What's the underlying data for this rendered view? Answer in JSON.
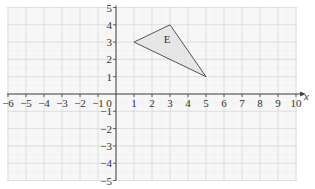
{
  "diagram": {
    "type": "coordinate-grid",
    "x_axis": {
      "label": "x",
      "min": -6,
      "max": 10,
      "ticks": [
        "-6",
        "-5",
        "-4",
        "-3",
        "-2",
        "-1",
        "0",
        "1",
        "2",
        "3",
        "4",
        "5",
        "6",
        "7",
        "8",
        "9",
        "10"
      ]
    },
    "y_axis": {
      "min": -5,
      "max": 5,
      "ticks": [
        "5",
        "4",
        "3",
        "2",
        "1",
        "-1",
        "-2",
        "-3",
        "-4",
        "-5"
      ]
    },
    "shape": {
      "label": "E",
      "vertices": [
        [
          1,
          3
        ],
        [
          3,
          4
        ],
        [
          5,
          1
        ]
      ],
      "fill": "#e6e6e6",
      "stroke": "#555555"
    },
    "colors": {
      "grid_major": "#d8d8d8",
      "grid_minor": "#ececec",
      "grid_bg": "#f7f7f7",
      "axis": "#444444"
    }
  }
}
